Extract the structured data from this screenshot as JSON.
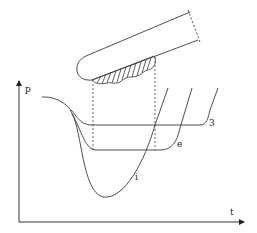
{
  "diagram": {
    "axes": {
      "y_label": "p",
      "x_label": "t"
    },
    "curves": [
      {
        "id": "3",
        "label": "3"
      },
      {
        "id": "e",
        "label": "e"
      },
      {
        "id": "i",
        "label": "i"
      }
    ],
    "elements": {
      "tube": "rounded-tube-with-hatched-deposit",
      "projection_lines": "dashed-vertical-lines"
    },
    "colors": {
      "stroke": "#3a3a3a",
      "background": "#ffffff"
    }
  }
}
